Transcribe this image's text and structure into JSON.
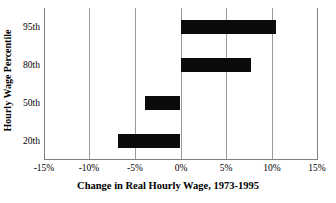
{
  "chart_data": {
    "type": "bar",
    "orientation": "horizontal",
    "title": "",
    "xlabel": "Change in Real Hourly Wage, 1973-1995",
    "ylabel": "Hourly Wage Percentile",
    "categories": [
      "20th",
      "50th",
      "80th",
      "95th"
    ],
    "values": [
      -6.9,
      -3.9,
      7.8,
      10.5
    ],
    "series": [
      {
        "name": "Change in Real Hourly Wage, 1973-1995",
        "values": [
          -6.9,
          -3.9,
          7.8,
          10.5
        ]
      }
    ],
    "xlim": [
      -15,
      15
    ],
    "xticks": [
      -15,
      -10,
      -5,
      0,
      5,
      10,
      15
    ],
    "xtick_labels": [
      "-15%",
      "-10%",
      "-5%",
      "0%",
      "5%",
      "10%",
      "15%"
    ],
    "ytick_labels": [
      "95th",
      "80th",
      "50th",
      "20th"
    ],
    "grid": "vertical",
    "legend": "none",
    "bar_color": "#0b0b0b",
    "gridline_color": "#9a9a9a",
    "axis_color": "#808080",
    "background_color": "#ffffff"
  },
  "axes": {
    "x_title": "Change in Real Hourly Wage, 1973-1995",
    "y_title": "Hourly Wage Percentile",
    "x_ticks": [
      {
        "label": "-15%",
        "value": -15
      },
      {
        "label": "-10%",
        "value": -10
      },
      {
        "label": "-5%",
        "value": -5
      },
      {
        "label": "0%",
        "value": 0
      },
      {
        "label": "5%",
        "value": 5
      },
      {
        "label": "10%",
        "value": 10
      },
      {
        "label": "15%",
        "value": 15
      }
    ],
    "y_ticks": [
      {
        "label": "95th",
        "value": 10.5
      },
      {
        "label": "80th",
        "value": 7.8
      },
      {
        "label": "50th",
        "value": -3.9
      },
      {
        "label": "20th",
        "value": -6.9
      }
    ]
  }
}
